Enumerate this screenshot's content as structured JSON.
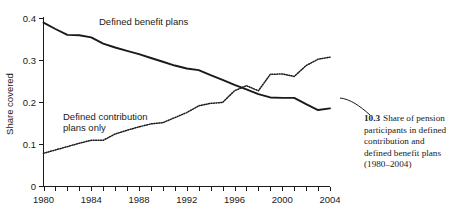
{
  "figure": {
    "caption_number": "10.3",
    "caption_text": "Share of pension participants in defined contribution and defined benefit plans (1980–2004)"
  },
  "chart_data": {
    "type": "line",
    "title": "",
    "xlabel": "",
    "ylabel": "Share covered",
    "xlim": [
      1980,
      2004
    ],
    "ylim": [
      0,
      0.4
    ],
    "grid": false,
    "legend_position": "inline-annotations",
    "x_ticks_labeled": [
      "1980",
      "1984",
      "1988",
      "1992",
      "1996",
      "2000",
      "2004"
    ],
    "y_ticks_labeled": [
      "0",
      "0.1",
      "0.2",
      "0.3",
      "0.4"
    ],
    "x_minor_tick_interval": 1,
    "x": [
      1980,
      1981,
      1982,
      1983,
      1984,
      1985,
      1986,
      1987,
      1988,
      1989,
      1990,
      1991,
      1992,
      1993,
      1994,
      1995,
      1996,
      1997,
      1998,
      1999,
      2000,
      2001,
      2002,
      2003,
      2004
    ],
    "series": [
      {
        "name": "Defined benefit plans",
        "style": "solid",
        "label_text": "Defined benefit plans",
        "values": [
          0.39,
          0.375,
          0.361,
          0.36,
          0.355,
          0.34,
          0.331,
          0.323,
          0.315,
          0.306,
          0.297,
          0.288,
          0.281,
          0.277,
          0.265,
          0.254,
          0.242,
          0.231,
          0.22,
          0.212,
          0.211,
          0.211,
          0.196,
          0.182,
          0.186
        ]
      },
      {
        "name": "Defined contribution plans only",
        "style": "dotted",
        "label_text": "Defined contribution plans only",
        "values": [
          0.079,
          0.087,
          0.095,
          0.103,
          0.11,
          0.11,
          0.125,
          0.134,
          0.142,
          0.149,
          0.152,
          0.164,
          0.176,
          0.192,
          0.198,
          0.2,
          0.228,
          0.24,
          0.228,
          0.267,
          0.268,
          0.262,
          0.288,
          0.303,
          0.308
        ]
      }
    ]
  }
}
